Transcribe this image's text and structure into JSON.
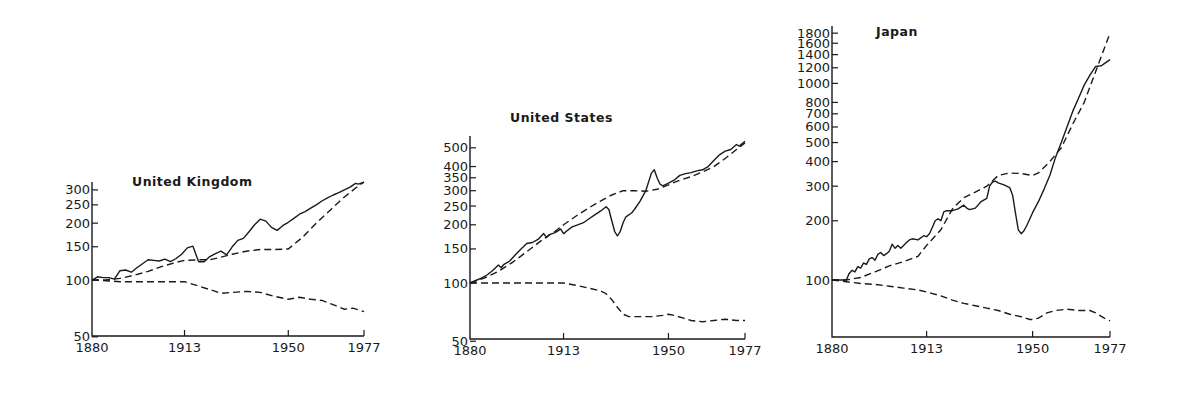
{
  "chart_data": [
    {
      "type": "line",
      "title": "United Kingdom",
      "xlabel": "",
      "ylabel": "",
      "yscale": "log",
      "ylim": [
        50,
        330
      ],
      "xlim": [
        1880,
        1977
      ],
      "x_ticks": [
        1880,
        1913,
        1950,
        1977
      ],
      "y_ticks": [
        50,
        100,
        150,
        200,
        250,
        300
      ],
      "grid": false,
      "legend": null,
      "layout": {
        "x0": 92,
        "x1": 364,
        "y100": 280,
        "k": 82,
        "baseline": 336,
        "top": 182,
        "title_x": 132,
        "title_y": 186
      },
      "series": [
        {
          "name": "solid",
          "style": "solid",
          "x": [
            1880,
            1882,
            1884,
            1886,
            1888,
            1890,
            1892,
            1894,
            1896,
            1898,
            1900,
            1902,
            1904,
            1906,
            1908,
            1910,
            1912,
            1914,
            1916,
            1918,
            1920,
            1922,
            1924,
            1926,
            1928,
            1930,
            1932,
            1934,
            1936,
            1938,
            1940,
            1942,
            1944,
            1946,
            1948,
            1950,
            1952,
            1954,
            1956,
            1958,
            1960,
            1962,
            1964,
            1966,
            1968,
            1970,
            1972,
            1974,
            1975,
            1977
          ],
          "y": [
            100,
            104,
            103,
            103,
            101,
            112,
            113,
            110,
            116,
            122,
            128,
            127,
            126,
            129,
            125,
            130,
            137,
            148,
            151,
            125,
            125,
            133,
            138,
            142,
            136,
            150,
            162,
            166,
            180,
            196,
            210,
            205,
            190,
            183,
            194,
            202,
            212,
            223,
            230,
            240,
            250,
            262,
            272,
            282,
            290,
            300,
            310,
            325,
            322,
            330
          ]
        },
        {
          "name": "dashed-upper",
          "style": "dashed",
          "x": [
            1880,
            1885,
            1890,
            1895,
            1900,
            1905,
            1910,
            1913,
            1918,
            1922,
            1926,
            1930,
            1935,
            1940,
            1945,
            1950,
            1955,
            1960,
            1965,
            1970,
            1975,
            1977
          ],
          "y": [
            100,
            100,
            102,
            106,
            111,
            118,
            124,
            127,
            128,
            128,
            132,
            137,
            142,
            145,
            145,
            146,
            168,
            200,
            235,
            275,
            315,
            330
          ]
        },
        {
          "name": "dashed-lower",
          "style": "dashed",
          "x": [
            1880,
            1885,
            1890,
            1895,
            1900,
            1905,
            1910,
            1913,
            1918,
            1922,
            1926,
            1930,
            1935,
            1940,
            1945,
            1950,
            1954,
            1958,
            1962,
            1966,
            1970,
            1973,
            1977
          ],
          "y": [
            100,
            99,
            98,
            98,
            98,
            98,
            98,
            98,
            93,
            89,
            85,
            86,
            87,
            86,
            82,
            79,
            81,
            79,
            78,
            74,
            70,
            71,
            68
          ]
        }
      ]
    },
    {
      "type": "line",
      "title": "United States",
      "xlabel": "",
      "ylabel": "",
      "yscale": "log",
      "ylim": [
        50,
        560
      ],
      "xlim": [
        1880,
        1977
      ],
      "x_ticks": [
        1880,
        1913,
        1950,
        1977
      ],
      "y_ticks": [
        50,
        100,
        150,
        200,
        250,
        300,
        350,
        400,
        500
      ],
      "grid": false,
      "legend": null,
      "layout": {
        "x0": 470,
        "x1": 745,
        "y100": 283,
        "k": 84,
        "baseline": 339,
        "top": 136,
        "title_x": 510,
        "title_y": 122
      },
      "series": [
        {
          "name": "solid",
          "style": "solid",
          "x": [
            1880,
            1882,
            1884,
            1886,
            1888,
            1890,
            1891,
            1892,
            1894,
            1896,
            1898,
            1900,
            1902,
            1904,
            1906,
            1907,
            1908,
            1910,
            1912,
            1913,
            1914,
            1916,
            1918,
            1920,
            1922,
            1924,
            1926,
            1928,
            1929,
            1930,
            1931,
            1932,
            1933,
            1934,
            1935,
            1937,
            1938,
            1940,
            1942,
            1944,
            1945,
            1946,
            1947,
            1948,
            1950,
            1952,
            1954,
            1956,
            1958,
            1960,
            1962,
            1964,
            1966,
            1968,
            1970,
            1972,
            1974,
            1975,
            1977
          ],
          "y": [
            100,
            103,
            106,
            110,
            116,
            124,
            120,
            125,
            130,
            140,
            150,
            160,
            162,
            168,
            180,
            172,
            178,
            182,
            190,
            180,
            185,
            195,
            200,
            205,
            215,
            225,
            235,
            248,
            240,
            210,
            185,
            175,
            185,
            205,
            220,
            230,
            240,
            265,
            300,
            370,
            385,
            350,
            325,
            318,
            328,
            340,
            360,
            368,
            372,
            380,
            385,
            400,
            430,
            460,
            480,
            490,
            520,
            510,
            540
          ]
        },
        {
          "name": "dashed-upper",
          "style": "dashed",
          "x": [
            1880,
            1885,
            1890,
            1895,
            1900,
            1905,
            1910,
            1913,
            1918,
            1922,
            1926,
            1930,
            1934,
            1938,
            1942,
            1946,
            1950,
            1954,
            1958,
            1962,
            1966,
            1970,
            1974,
            1977
          ],
          "y": [
            100,
            106,
            115,
            128,
            145,
            165,
            185,
            200,
            225,
            245,
            265,
            285,
            300,
            300,
            298,
            305,
            322,
            340,
            355,
            375,
            400,
            440,
            490,
            530
          ]
        },
        {
          "name": "dashed-lower",
          "style": "dashed",
          "x": [
            1880,
            1885,
            1890,
            1895,
            1900,
            1905,
            1910,
            1913,
            1918,
            1922,
            1926,
            1928,
            1930,
            1932,
            1934,
            1936,
            1940,
            1944,
            1948,
            1950,
            1952,
            1955,
            1958,
            1962,
            1966,
            1970,
            1974,
            1977
          ],
          "y": [
            100,
            100,
            100,
            100,
            100,
            100,
            100,
            100,
            97,
            94,
            91,
            88,
            82,
            75,
            69,
            67,
            67,
            67,
            68,
            69,
            68,
            66,
            64,
            63,
            64,
            65,
            64,
            64
          ]
        }
      ]
    },
    {
      "type": "line",
      "title": "Japan",
      "xlabel": "",
      "ylabel": "",
      "yscale": "log",
      "ylim": [
        55,
        1900
      ],
      "xlim": [
        1880,
        1977
      ],
      "x_ticks": [
        1880,
        1913,
        1950,
        1977
      ],
      "y_ticks": [
        100,
        200,
        300,
        400,
        500,
        600,
        700,
        800,
        1000,
        1200,
        1400,
        1600,
        1800
      ],
      "grid": false,
      "legend": null,
      "layout": {
        "x0": 832,
        "x1": 1110,
        "y100": 280,
        "k": 85.4,
        "baseline": 337,
        "top": 26,
        "title_x": 876,
        "title_y": 36
      },
      "series": [
        {
          "name": "solid",
          "style": "solid",
          "x": [
            1880,
            1885,
            1886,
            1887,
            1888,
            1889,
            1890,
            1891,
            1892,
            1893,
            1894,
            1895,
            1896,
            1897,
            1898,
            1899,
            1900,
            1901,
            1902,
            1903,
            1904,
            1905,
            1906,
            1907,
            1908,
            1910,
            1912,
            1913,
            1914,
            1915,
            1916,
            1917,
            1918,
            1919,
            1920,
            1922,
            1924,
            1926,
            1927,
            1928,
            1930,
            1932,
            1934,
            1935,
            1936,
            1937,
            1938,
            1940,
            1942,
            1943,
            1944,
            1945,
            1946,
            1947,
            1948,
            1950,
            1952,
            1954,
            1956,
            1958,
            1960,
            1962,
            1964,
            1966,
            1968,
            1970,
            1972,
            1974,
            1975,
            1977
          ],
          "y": [
            100,
            100,
            108,
            112,
            110,
            117,
            115,
            122,
            120,
            128,
            130,
            126,
            135,
            138,
            133,
            136,
            140,
            152,
            145,
            150,
            145,
            150,
            155,
            160,
            162,
            160,
            168,
            166,
            172,
            185,
            200,
            205,
            200,
            222,
            225,
            225,
            230,
            240,
            232,
            228,
            232,
            250,
            260,
            300,
            315,
            318,
            312,
            305,
            295,
            270,
            220,
            180,
            172,
            178,
            190,
            220,
            250,
            290,
            340,
            420,
            500,
            600,
            720,
            840,
            980,
            1100,
            1220,
            1230,
            1260,
            1320
          ]
        },
        {
          "name": "dashed-upper",
          "style": "dashed",
          "x": [
            1880,
            1885,
            1890,
            1895,
            1900,
            1905,
            1910,
            1913,
            1918,
            1922,
            1926,
            1930,
            1934,
            1938,
            1942,
            1946,
            1950,
            1952,
            1956,
            1960,
            1964,
            1968,
            1972,
            1977
          ],
          "y": [
            100,
            100,
            103,
            110,
            118,
            124,
            132,
            150,
            180,
            230,
            262,
            280,
            300,
            340,
            350,
            348,
            340,
            350,
            400,
            470,
            620,
            800,
            1150,
            1800
          ]
        },
        {
          "name": "dashed-lower",
          "style": "dashed",
          "x": [
            1880,
            1885,
            1890,
            1895,
            1900,
            1905,
            1910,
            1913,
            1918,
            1922,
            1926,
            1930,
            1934,
            1938,
            1942,
            1946,
            1949,
            1950,
            1952,
            1955,
            1958,
            1962,
            1966,
            1970,
            1972,
            1975,
            1977
          ],
          "y": [
            100,
            98,
            96,
            95,
            93,
            91,
            89,
            87,
            83,
            79,
            76,
            74,
            72,
            70,
            67,
            65,
            63,
            63,
            64,
            68,
            70,
            71,
            70,
            70,
            68,
            64,
            62
          ]
        }
      ]
    }
  ]
}
